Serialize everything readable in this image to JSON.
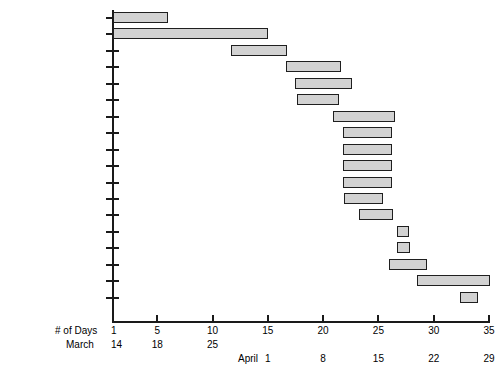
{
  "figure": {
    "title_remnant": "Production Schedule",
    "bar_fill_color": "#d2d2d2",
    "bar_border_color": "#1f1f1f",
    "axis_color": "#1a1a1a"
  },
  "axis": {
    "days_caption": "# of Days",
    "march_caption": "March",
    "april_caption": "April",
    "day_ticks": [
      1,
      5,
      10,
      15,
      20,
      25,
      30,
      35
    ],
    "day_tick_labels": [
      "1",
      "5",
      "10",
      "15",
      "20",
      "25",
      "30",
      "35"
    ],
    "march_labels": [
      {
        "day": 1,
        "text": "14"
      },
      {
        "day": 5,
        "text": "18"
      },
      {
        "day": 10,
        "text": "25"
      }
    ],
    "april_labels": [
      {
        "day": 15,
        "text": "1"
      },
      {
        "day": 20,
        "text": "8"
      },
      {
        "day": 25,
        "text": "15"
      },
      {
        "day": 30,
        "text": "22"
      },
      {
        "day": 35,
        "text": "29"
      }
    ]
  },
  "chart_data": {
    "type": "bar",
    "orientation": "horizontal",
    "subtype": "gantt",
    "title": "Production Schedule",
    "xlabel": "# of Days",
    "ylabel": "",
    "xlim": [
      1,
      35
    ],
    "grid": false,
    "legend": "none",
    "categories": [
      "Solicit Articles & TNs",
      "Solicit/Write/Edit TNs",
      "PRs to SME",
      "1st Editing Cycle",
      "Graphics to Layout Editor",
      "Dump/Edit PRs",
      "Edited Articles to Authors and SMEs",
      "1st Edits to Layout Editor",
      "2nd Editing Cycle",
      "Update FaxAd. & SRLs",
      "Create Index",
      "Edit & Layout Mods",
      "Layout/Lino Cover",
      "Create TOC & Update Frontmatter",
      "Edit Index",
      "Final Edits/inputs",
      "Print Cycle",
      "Edit Blueline"
    ],
    "tasks": [
      {
        "name": "Solicit Articles & TNs",
        "start": 1,
        "end": 6,
        "duration": 5
      },
      {
        "name": "Solicit/Write/Edit TNs",
        "start": 1,
        "end": 15,
        "duration": 14
      },
      {
        "name": "PRs to SME",
        "start": 11.7,
        "end": 16.7,
        "duration": 5
      },
      {
        "name": "1st Editing Cycle",
        "start": 16.6,
        "end": 21.6,
        "duration": 5
      },
      {
        "name": "Graphics to Layout Editor",
        "start": 17.5,
        "end": 22.6,
        "duration": 5.1
      },
      {
        "name": "Dump/Edit PRs",
        "start": 17.6,
        "end": 21.4,
        "duration": 3.8
      },
      {
        "name": "Edited Articles to Authors and SMEs",
        "start": 20.9,
        "end": 26.5,
        "duration": 5.6
      },
      {
        "name": "1st Edits to Layout Editor",
        "start": 21.8,
        "end": 26.2,
        "duration": 4.4
      },
      {
        "name": "2nd Editing Cycle",
        "start": 21.8,
        "end": 26.2,
        "duration": 4.4
      },
      {
        "name": "Update FaxAd. & SRLs",
        "start": 21.8,
        "end": 26.2,
        "duration": 4.4
      },
      {
        "name": "Create Index",
        "start": 21.8,
        "end": 26.2,
        "duration": 4.4
      },
      {
        "name": "Edit & Layout Mods",
        "start": 21.9,
        "end": 25.4,
        "duration": 3.5
      },
      {
        "name": "Layout/Lino Cover",
        "start": 23.2,
        "end": 26.3,
        "duration": 3.1
      },
      {
        "name": "Create TOC & Update Frontmatter",
        "start": 26.7,
        "end": 27.8,
        "duration": 1.1
      },
      {
        "name": "Edit Index",
        "start": 26.7,
        "end": 27.9,
        "duration": 1.2
      },
      {
        "name": "Final Edits/inputs",
        "start": 26.0,
        "end": 29.4,
        "duration": 3.4
      },
      {
        "name": "Print Cycle",
        "start": 28.5,
        "end": 35.1,
        "duration": 6.6
      },
      {
        "name": "Edit Blueline",
        "start": 32.4,
        "end": 34.0,
        "duration": 1.6
      }
    ]
  }
}
